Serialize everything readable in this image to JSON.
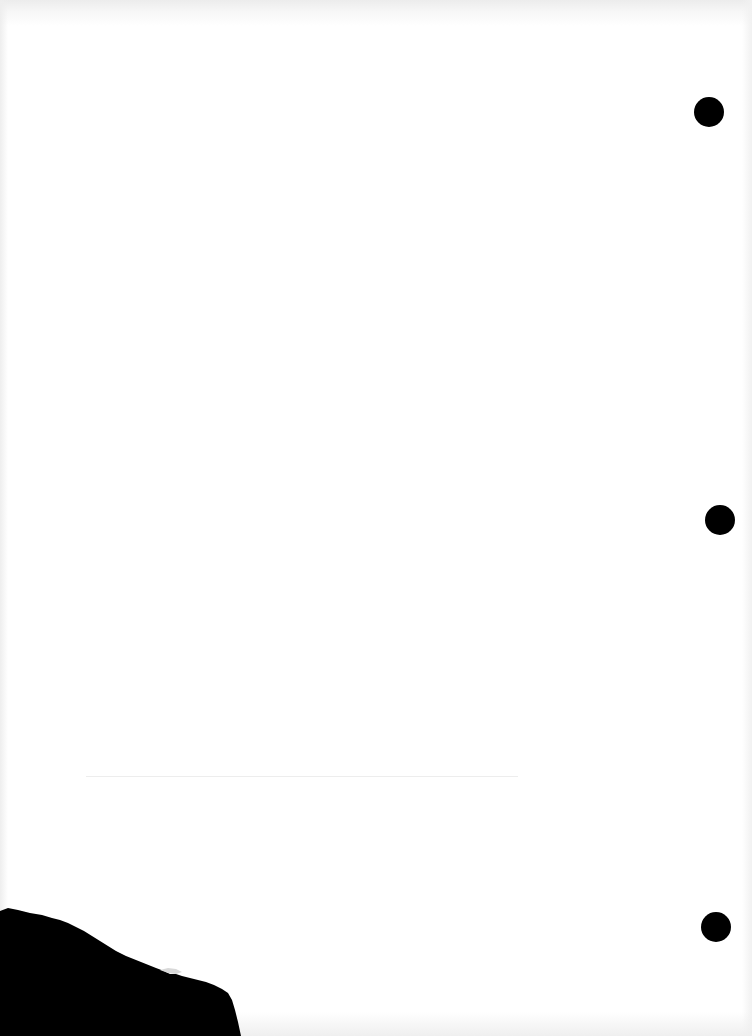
{
  "document": {
    "type": "blank-scanned-page",
    "background_color": "#ffffff",
    "ink_color": "#000000",
    "rule_color": "#ededed",
    "punch_holes": [
      {
        "cx": 709,
        "cy": 112,
        "r": 15
      },
      {
        "cx": 720,
        "cy": 520,
        "r": 15
      },
      {
        "cx": 716,
        "cy": 927,
        "r": 15
      }
    ],
    "rule_line": {
      "x1": 86,
      "x2": 518,
      "y": 776
    },
    "torn_corner": {
      "position": "bottom-left",
      "color": "#000000"
    }
  }
}
